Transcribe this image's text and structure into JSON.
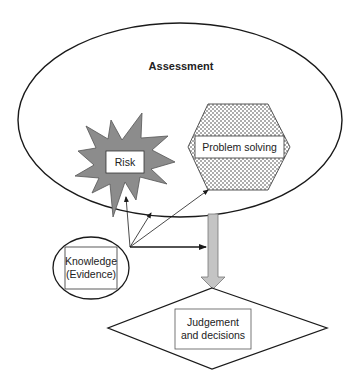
{
  "diagram": {
    "assessment": {
      "label": "Assessment"
    },
    "risk": {
      "label": "Risk"
    },
    "problem_solving": {
      "label": "Problem solving"
    },
    "knowledge": {
      "line1": "Knowledge",
      "line2": "(Evidence)"
    },
    "judgement": {
      "line1": "Judgement",
      "line2": "and decisions"
    }
  },
  "colors": {
    "stroke": "#1a1a1a",
    "starburst_fill": "#8c8c8c",
    "arrow_fill": "#c4c4c4",
    "box_fill": "#ffffff"
  }
}
